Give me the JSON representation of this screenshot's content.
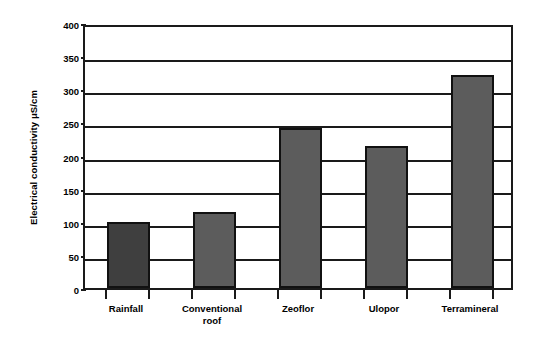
{
  "chart_data": {
    "type": "bar",
    "title": "",
    "xlabel": "",
    "ylabel": "Electrical conductivity μS/cm",
    "categories": [
      "Rainfall",
      "Conventional roof",
      "Zeoflor",
      "Ulopor",
      "Terramineral"
    ],
    "category_lines": [
      [
        "Rainfall"
      ],
      [
        "Conventional",
        "roof"
      ],
      [
        "Zeoflor"
      ],
      [
        "Ulopor"
      ],
      [
        "Terramineral"
      ]
    ],
    "values": [
      100,
      114,
      242,
      215,
      322
    ],
    "ylim": [
      0,
      400
    ],
    "ytick_step": 50,
    "ytick_labels": [
      "400",
      "350",
      "300",
      "250",
      "200",
      "150",
      "100",
      "50",
      "0"
    ],
    "ytick_values": [
      400,
      350,
      300,
      250,
      200,
      150,
      100,
      50,
      0
    ],
    "grid": true,
    "legend": "none",
    "bar_colors": [
      "#3f3f3f",
      "#5c5c5c",
      "#5c5c5c",
      "#5c5c5c",
      "#5c5c5c"
    ],
    "bar_border_color": "#111111",
    "axis_color": "#1a1a1a",
    "background_color": "#ffffff"
  }
}
